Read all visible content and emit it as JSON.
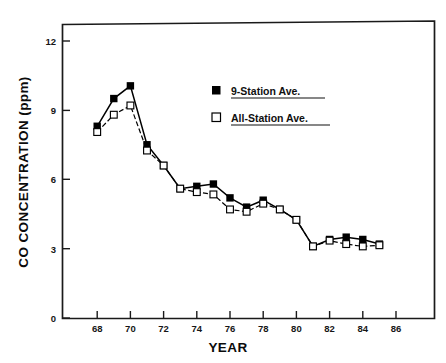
{
  "chart_data": {
    "type": "line",
    "title": "",
    "subtitle": "",
    "xlabel": "YEAR",
    "ylabel": "CO CONCENTRATION (ppm)",
    "xlim": [
      66.2,
      87.6
    ],
    "ylim": [
      0,
      13.2
    ],
    "xticks": [
      68,
      70,
      72,
      74,
      76,
      78,
      80,
      82,
      84,
      86
    ],
    "xtick_labels": [
      "68",
      "70",
      "72",
      "74",
      "76",
      "78",
      "80",
      "82",
      "84",
      "86"
    ],
    "yticks": [
      0,
      3,
      6,
      9,
      12
    ],
    "ytick_labels": [
      "0",
      "3",
      "6",
      "9",
      "12"
    ],
    "grid": false,
    "legend_position": "upper-center-right",
    "x": [
      68,
      69,
      70,
      71,
      72,
      73,
      74,
      75,
      76,
      77,
      78,
      79,
      80,
      81,
      82,
      83,
      84,
      85
    ],
    "series": [
      {
        "name": "9-Station Ave.",
        "marker": "filled-square",
        "color": "#000000",
        "linestyle": "solid",
        "values": [
          8.3,
          9.5,
          10.05,
          7.5,
          6.6,
          5.6,
          5.7,
          5.8,
          5.2,
          4.8,
          5.1,
          4.7,
          4.25,
          3.1,
          3.4,
          3.5,
          3.4,
          3.2
        ]
      },
      {
        "name": "All-Station Ave.",
        "marker": "open-square",
        "color": "#000000",
        "linestyle": "dashed",
        "values": [
          8.05,
          8.8,
          9.2,
          7.25,
          6.6,
          5.6,
          5.45,
          5.35,
          4.7,
          4.6,
          4.95,
          4.7,
          4.25,
          3.1,
          3.35,
          3.2,
          3.1,
          3.15
        ]
      }
    ]
  },
  "legend": {
    "entries": [
      {
        "label": "9-Station Ave.",
        "marker": "filled-square"
      },
      {
        "label": "All-Station Ave.",
        "marker": "open-square"
      }
    ]
  },
  "axes": {
    "x_title": "YEAR",
    "y_title": "CO CONCENTRATION (ppm)"
  }
}
